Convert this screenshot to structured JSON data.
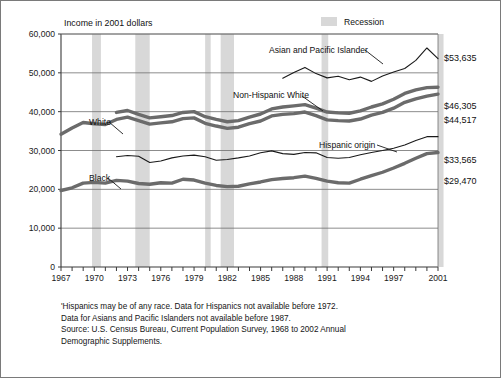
{
  "header": {
    "axis_title": "Income in 2001 dollars",
    "legend_label": "Recession",
    "legend_swatch_color": "#d8d8d8"
  },
  "footnotes": [
    "'Hispanics may be of any race. Data for Hispanics not available before 1972.",
    "Data for Asians and Pacific Islanders not available before 1987.",
    "Source: U.S. Census Bureau, Current Population Survey, 1968 to 2002 Annual",
    "Demographic Supplements."
  ],
  "end_values": [
    {
      "name": "asian-pacific-islander",
      "label": "$53,635",
      "value": 53635,
      "y_px": 60
    },
    {
      "name": "non-hispanic-white",
      "label": "$46,305",
      "value": 46305,
      "y_px": 108
    },
    {
      "name": "white",
      "label": "$44,517",
      "value": 44517,
      "y_px": 122
    },
    {
      "name": "hispanic-origin",
      "label": "$33,565",
      "value": 33565,
      "y_px": 162
    },
    {
      "name": "black",
      "label": "$29,470",
      "value": 29470,
      "y_px": 183
    }
  ],
  "chart_data": {
    "type": "line",
    "title": "Income in 2001 dollars",
    "xlabel": "",
    "ylabel": "Income in 2001 dollars",
    "xlim": [
      1967,
      2001
    ],
    "ylim": [
      0,
      60000
    ],
    "grid": true,
    "y_ticks": [
      0,
      10000,
      20000,
      30000,
      40000,
      50000,
      60000
    ],
    "y_tick_labels": [
      "0",
      "10,000",
      "20,000",
      "30,000",
      "40,000",
      "50,000",
      "60,000"
    ],
    "x_ticks": [
      1967,
      1968,
      1969,
      1970,
      1971,
      1972,
      1973,
      1974,
      1975,
      1976,
      1977,
      1978,
      1979,
      1980,
      1981,
      1982,
      1983,
      1984,
      1985,
      1986,
      1987,
      1988,
      1989,
      1990,
      1991,
      1992,
      1993,
      1994,
      1995,
      1996,
      1997,
      1998,
      1999,
      2000,
      2001
    ],
    "x_tick_labels": [
      "1967",
      "1970",
      "1973",
      "1976",
      "1979",
      "1982",
      "1985",
      "1988",
      "1991",
      "1994",
      "1997",
      "2001"
    ],
    "x_tick_label_years": [
      1967,
      1970,
      1973,
      1976,
      1979,
      1982,
      1985,
      1988,
      1991,
      1994,
      1997,
      2001
    ],
    "legend_position": "top-right",
    "recession_bands": [
      {
        "start": 1969.8,
        "end": 1970.6
      },
      {
        "start": 1973.7,
        "end": 1975.0
      },
      {
        "start": 1980.0,
        "end": 1980.5
      },
      {
        "start": 1981.4,
        "end": 1982.6
      },
      {
        "start": 1990.5,
        "end": 1991.1
      },
      {
        "start": 2001.0,
        "end": 2001.5
      }
    ],
    "series": [
      {
        "name": "White",
        "label_text": "White",
        "style": "thick",
        "color": "#6b6b6b",
        "start_year": 1967,
        "values": [
          34200,
          35800,
          37200,
          36900,
          36700,
          38000,
          38600,
          37700,
          36800,
          37100,
          37400,
          38200,
          38400,
          37000,
          36300,
          35700,
          36000,
          36900,
          37600,
          38900,
          39300,
          39500,
          39900,
          39000,
          37900,
          37700,
          37600,
          38100,
          39100,
          39800,
          40900,
          42400,
          43300,
          44000,
          44517
        ]
      },
      {
        "name": "Non-Hispanic White",
        "label_text": "Non-Hispanic White",
        "style": "thick",
        "color": "#6b6b6b",
        "start_year": 1972,
        "values": [
          39800,
          40300,
          39300,
          38400,
          38700,
          39000,
          39800,
          40000,
          38700,
          38000,
          37400,
          37700,
          38600,
          39400,
          40700,
          41200,
          41500,
          41800,
          40900,
          39900,
          39700,
          39600,
          40200,
          41200,
          42000,
          43200,
          44700,
          45600,
          46200,
          46305
        ]
      },
      {
        "name": "Black",
        "label_text": "Black",
        "style": "thick",
        "color": "#6b6b6b",
        "start_year": 1967,
        "values": [
          19700,
          20400,
          21600,
          21800,
          21600,
          22300,
          22100,
          21500,
          21300,
          21700,
          21600,
          22600,
          22400,
          21600,
          21000,
          20700,
          20800,
          21400,
          21900,
          22500,
          22800,
          23000,
          23400,
          22800,
          22100,
          21700,
          21600,
          22600,
          23500,
          24400,
          25500,
          26700,
          28000,
          29200,
          29470
        ]
      },
      {
        "name": "Hispanic origin",
        "label_text": "Hispanic origin",
        "style": "thin",
        "color": "#1a1a1a",
        "start_year": 1972,
        "values": [
          28400,
          28700,
          28500,
          26900,
          27300,
          28100,
          28600,
          28800,
          28400,
          27500,
          27700,
          28100,
          28600,
          29400,
          29900,
          29200,
          29000,
          29500,
          29400,
          28200,
          28000,
          28200,
          28900,
          29500,
          30000,
          30600,
          31400,
          32600,
          33565,
          33565
        ]
      },
      {
        "name": "Asian and Pacific Islander",
        "label_text": "Asian and Pacific Islander",
        "style": "thin",
        "color": "#1a1a1a",
        "start_year": 1987,
        "values": [
          48600,
          50100,
          51400,
          49800,
          48700,
          49100,
          48200,
          48900,
          47800,
          49200,
          50200,
          51100,
          53200,
          56400,
          53635
        ]
      }
    ],
    "annotations": [
      {
        "text": "White",
        "x_px": 88,
        "y_px": 124,
        "leader": true
      },
      {
        "text": "Black",
        "x_px": 88,
        "y_px": 180,
        "leader": true
      },
      {
        "text": "Non-Hispanic White",
        "x_px": 232,
        "y_px": 97,
        "leader": true
      },
      {
        "text": "Hispanic origin",
        "x_px": 318,
        "y_px": 147,
        "leader": true
      },
      {
        "text": "Asian and Pacific Islander",
        "x_px": 268,
        "y_px": 52,
        "leader": true
      }
    ]
  }
}
